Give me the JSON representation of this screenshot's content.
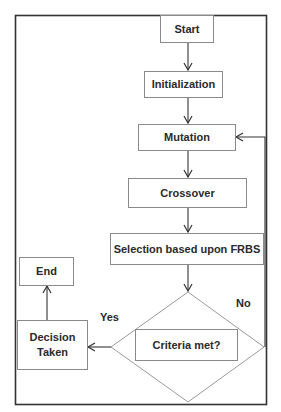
{
  "diagram": {
    "type": "flowchart",
    "nodes": {
      "start": "Start",
      "initialization": "Initialization",
      "mutation": "Mutation",
      "crossover": "Crossover",
      "selection": "Selection based upon FRBS",
      "criteria": "Criteria met?",
      "decision": "Decision Taken",
      "end": "End"
    },
    "labels": {
      "yes": "Yes",
      "no": "No"
    },
    "edges": [
      {
        "from": "Start",
        "to": "Initialization"
      },
      {
        "from": "Initialization",
        "to": "Mutation"
      },
      {
        "from": "Mutation",
        "to": "Crossover"
      },
      {
        "from": "Crossover",
        "to": "Selection based upon FRBS"
      },
      {
        "from": "Selection based upon FRBS",
        "to": "Criteria met?"
      },
      {
        "from": "Criteria met?",
        "to": "Decision Taken",
        "label": "Yes"
      },
      {
        "from": "Criteria met?",
        "to": "Mutation",
        "label": "No"
      },
      {
        "from": "Decision Taken",
        "to": "End"
      }
    ]
  }
}
